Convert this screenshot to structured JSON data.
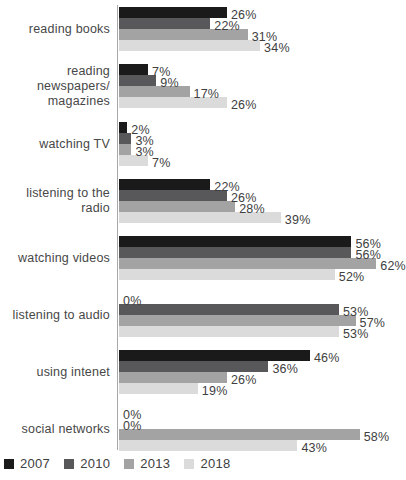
{
  "chart_data": {
    "type": "bar",
    "orientation": "horizontal",
    "title": "",
    "xlabel": "",
    "ylabel": "",
    "value_suffix": "%",
    "xlim": [
      0,
      69
    ],
    "grid": false,
    "legend_position": "bottom-left",
    "axis_color": "#a8a8a8",
    "categories": [
      "reading books",
      "reading newspapers/\nmagazines",
      "watching TV",
      "listening to the radio",
      "watching videos",
      "listening to audio",
      "using intenet",
      "social networks"
    ],
    "series": [
      {
        "name": "2007",
        "color": "#1a1a1a",
        "values": [
          26,
          7,
          2,
          22,
          56,
          0,
          46,
          0
        ]
      },
      {
        "name": "2010",
        "color": "#58585a",
        "values": [
          22,
          9,
          3,
          26,
          56,
          53,
          36,
          0
        ]
      },
      {
        "name": "2013",
        "color": "#a3a3a3",
        "values": [
          31,
          17,
          3,
          28,
          62,
          57,
          26,
          58
        ]
      },
      {
        "name": "2018",
        "color": "#dbdbdb",
        "values": [
          34,
          26,
          7,
          39,
          52,
          53,
          19,
          43
        ]
      }
    ]
  },
  "legend": {
    "items": [
      {
        "label": "2007",
        "color": "#1a1a1a"
      },
      {
        "label": "2010",
        "color": "#58585a"
      },
      {
        "label": "2013",
        "color": "#a3a3a3"
      },
      {
        "label": "2018",
        "color": "#dbdbdb"
      }
    ]
  },
  "layout_hints": {
    "px_per_percent": 4.15
  }
}
